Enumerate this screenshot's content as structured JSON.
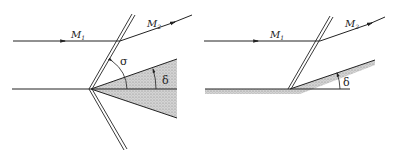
{
  "figure": {
    "left": {
      "labels": {
        "m1": "M",
        "m1_sub": "1",
        "m2": "M",
        "m2_sub": "2",
        "sigma": "σ",
        "delta": "δ"
      },
      "description": "Symmetric wedge with oblique shock; flow M1 deflected to M2"
    },
    "right": {
      "labels": {
        "m1": "M",
        "m1_sub": "1",
        "m2": "M",
        "m2_sub": "2",
        "delta": "δ"
      },
      "description": "Compression corner (wall ramp) with oblique shock; flow M1 deflected to M2"
    },
    "colors": {
      "line": "#222222",
      "shade": "#c8c8c8",
      "background": "#ffffff"
    }
  }
}
